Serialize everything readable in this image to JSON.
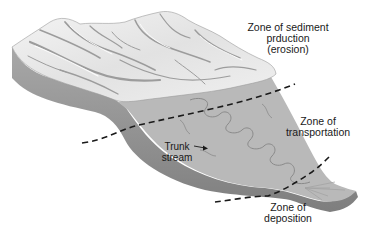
{
  "diagram": {
    "type": "landscape block diagram of a fluvial system",
    "colors": {
      "background": "#ffffff",
      "mountain_light": "#ececec",
      "mountain_shadow": "#9a9a9a",
      "block_side": "#8c8c8c",
      "plain_fill": "#b9b9b9",
      "stream_line": "#8a8a8a",
      "boundary_line": "#1a1a1a",
      "text": "#1a1a1a"
    },
    "zones": [
      {
        "id": "erosion",
        "lines": [
          "Zone of sediment",
          "prduction",
          "(erosion)"
        ]
      },
      {
        "id": "transportation",
        "lines": [
          "Zone of",
          "transportation"
        ]
      },
      {
        "id": "deposition",
        "lines": [
          "Zone of",
          "deposition"
        ]
      }
    ],
    "annotations": [
      {
        "id": "trunk-stream",
        "lines": [
          "Trunk",
          "stream"
        ],
        "arrow": true
      }
    ],
    "boundaries": [
      {
        "id": "erosion-transport-boundary",
        "style": "dashed"
      },
      {
        "id": "transport-deposition-boundary",
        "style": "dashed"
      }
    ]
  }
}
